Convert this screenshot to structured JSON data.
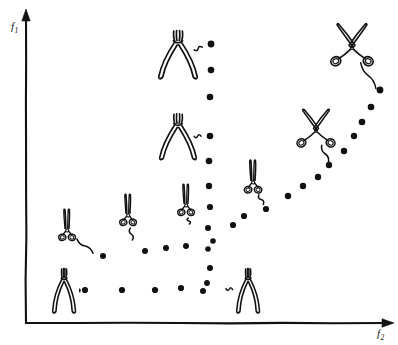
{
  "figure": {
    "background_color": "#ffffff",
    "ink_color": "#111111",
    "width": 398,
    "height": 345
  },
  "axes": {
    "x": {
      "label": "f",
      "label_subscript": "2",
      "label_full": "f2",
      "name": "horizontal-objective-axis",
      "origin_px": [
        26,
        323
      ],
      "end_px": [
        385,
        323
      ],
      "arrow": true
    },
    "y": {
      "label": "f",
      "label_subscript": "1",
      "label_full": "f1",
      "name": "vertical-objective-axis",
      "origin_px": [
        26,
        323
      ],
      "end_px": [
        26,
        18
      ],
      "arrow": true
    }
  },
  "chart_data": {
    "type": "scatter",
    "title": "",
    "xlabel": "f2",
    "ylabel": "f1",
    "grid": false,
    "legend": null,
    "series": [
      {
        "name": "pareto-front-points",
        "marker": "filled-circle",
        "points": [
          {
            "x": 211,
            "y": 44,
            "r": 3.4
          },
          {
            "x": 211,
            "y": 70,
            "r": 3.3
          },
          {
            "x": 210,
            "y": 97,
            "r": 3.3
          },
          {
            "x": 210,
            "y": 136,
            "r": 3.3
          },
          {
            "x": 209,
            "y": 161,
            "r": 3.3
          },
          {
            "x": 209,
            "y": 186,
            "r": 3.2
          },
          {
            "x": 210,
            "y": 207,
            "r": 3.1
          },
          {
            "x": 208,
            "y": 228,
            "r": 3.0
          },
          {
            "x": 213,
            "y": 241,
            "r": 2.8
          },
          {
            "x": 208,
            "y": 249,
            "r": 2.8
          },
          {
            "x": 210,
            "y": 268,
            "r": 3.0
          },
          {
            "x": 207,
            "y": 283,
            "r": 2.9
          },
          {
            "x": 203,
            "y": 291,
            "r": 3.0
          },
          {
            "x": 233,
            "y": 225,
            "r": 3.1
          },
          {
            "x": 244,
            "y": 216,
            "r": 3.1
          },
          {
            "x": 266,
            "y": 209,
            "r": 3.1
          },
          {
            "x": 288,
            "y": 196,
            "r": 3.2
          },
          {
            "x": 303,
            "y": 186,
            "r": 3.2
          },
          {
            "x": 318,
            "y": 177,
            "r": 3.2
          },
          {
            "x": 329,
            "y": 165,
            "r": 3.2
          },
          {
            "x": 344,
            "y": 151,
            "r": 3.2
          },
          {
            "x": 354,
            "y": 136,
            "r": 3.2
          },
          {
            "x": 362,
            "y": 122,
            "r": 3.3
          },
          {
            "x": 371,
            "y": 107,
            "r": 3.3
          },
          {
            "x": 380,
            "y": 90,
            "r": 3.4
          },
          {
            "x": 85,
            "y": 290,
            "r": 3.1
          },
          {
            "x": 122,
            "y": 290,
            "r": 3.1
          },
          {
            "x": 155,
            "y": 290,
            "r": 3.1
          },
          {
            "x": 181,
            "y": 288,
            "r": 3.1
          },
          {
            "x": 166,
            "y": 248,
            "r": 3.0
          },
          {
            "x": 186,
            "y": 246,
            "r": 3.0
          },
          {
            "x": 145,
            "y": 251,
            "r": 3.0
          },
          {
            "x": 103,
            "y": 256,
            "r": 3.0
          }
        ]
      }
    ],
    "annotations": [
      {
        "id": "tool-1",
        "icon": "pliers-open-icon",
        "label": "pliers",
        "x": 178,
        "y": 55,
        "scale": 1.0,
        "leader_to": [
          206,
          46
        ]
      },
      {
        "id": "tool-2",
        "icon": "pliers-open-icon",
        "label": "pliers",
        "x": 178,
        "y": 137,
        "scale": 0.95,
        "leader_to": [
          205,
          136
        ]
      },
      {
        "id": "tool-3",
        "icon": "scissors-open-icon",
        "label": "scissors",
        "x": 352,
        "y": 48,
        "scale": 1.0,
        "leader_to": [
          378,
          92
        ]
      },
      {
        "id": "tool-4",
        "icon": "scissors-open-icon",
        "label": "scissors",
        "x": 316,
        "y": 131,
        "scale": 0.9,
        "leader_to": [
          330,
          166
        ]
      },
      {
        "id": "tool-5",
        "icon": "scissors-closed-icon",
        "label": "scissors",
        "x": 253,
        "y": 182,
        "scale": 0.82,
        "leader_to": [
          265,
          208
        ]
      },
      {
        "id": "tool-6",
        "icon": "scissors-closed-icon",
        "label": "scissors",
        "x": 186,
        "y": 205,
        "scale": 0.78,
        "leader_to": [
          190,
          228
        ]
      },
      {
        "id": "tool-7",
        "icon": "scissors-closed-icon",
        "label": "scissors",
        "x": 128,
        "y": 215,
        "scale": 0.78,
        "leader_to": [
          133,
          244
        ]
      },
      {
        "id": "tool-8",
        "icon": "scissors-closed-icon",
        "label": "scissors",
        "x": 67,
        "y": 230,
        "scale": 0.78,
        "leader_to": [
          96,
          256
        ]
      },
      {
        "id": "tool-9",
        "icon": "pliers-closed-icon",
        "label": "pliers",
        "x": 64,
        "y": 292,
        "scale": 0.92,
        "leader_to": [
          84,
          290
        ]
      },
      {
        "id": "tool-10",
        "icon": "pliers-closed-icon",
        "label": "pliers",
        "x": 248,
        "y": 292,
        "scale": 0.92,
        "leader_to": [
          222,
          288
        ]
      }
    ]
  }
}
